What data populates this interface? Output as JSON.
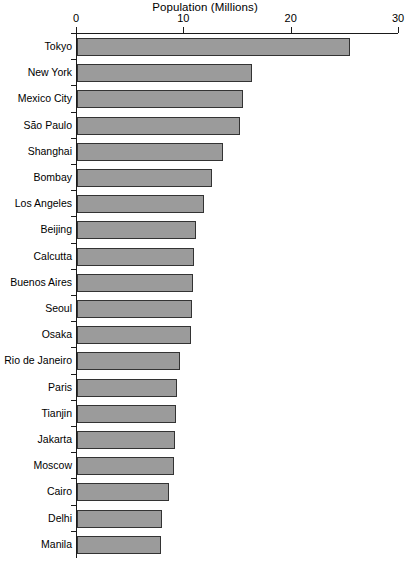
{
  "chart_data": {
    "type": "bar",
    "orientation": "horizontal",
    "title": "Population (Millions)",
    "xlabel": "",
    "ylabel": "",
    "xlim": [
      0,
      30
    ],
    "xticks": [
      0,
      10,
      20,
      30
    ],
    "xtick_labels": [
      "0",
      "10",
      "20",
      "30"
    ],
    "grid": false,
    "legend": false,
    "bar_color": "#9b9b9b",
    "bar_edge_color": "#333333",
    "axis_color": "#1a1a1a",
    "categories": [
      "Tokyo",
      "New York",
      "Mexico City",
      "São Paulo",
      "Shanghai",
      "Bombay",
      "Los Angeles",
      "Beijing",
      "Calcutta",
      "Buenos Aires",
      "Seoul",
      "Osaka",
      "Rio de Janeiro",
      "Paris",
      "Tianjin",
      "Jakarta",
      "Moscow",
      "Cairo",
      "Delhi",
      "Manila"
    ],
    "values": [
      25.4,
      16.3,
      15.5,
      15.2,
      13.6,
      12.6,
      11.8,
      11.1,
      10.9,
      10.8,
      10.7,
      10.6,
      9.6,
      9.3,
      9.2,
      9.1,
      9.0,
      8.6,
      7.9,
      7.8
    ]
  }
}
